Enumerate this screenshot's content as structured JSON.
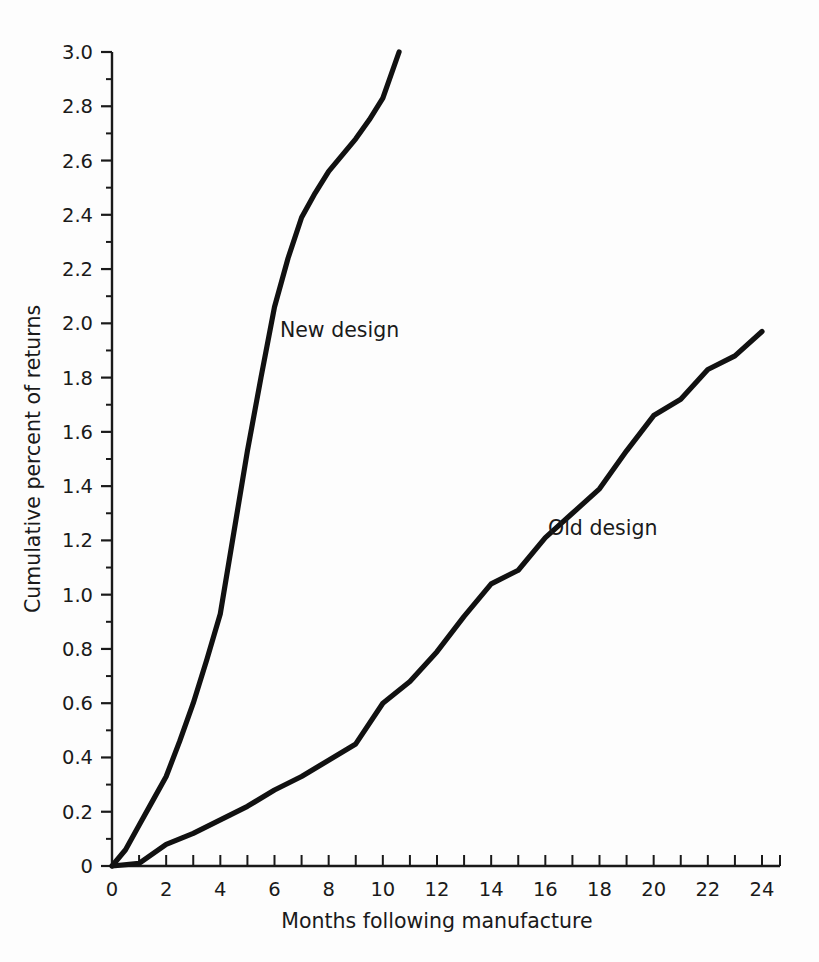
{
  "chart_data": {
    "type": "line",
    "title": "",
    "xlabel": "Months following manufacture",
    "ylabel": "Cumulative percent of returns",
    "xlim": [
      0,
      24
    ],
    "ylim": [
      0,
      3.0
    ],
    "x_tick_labels": [
      "0",
      "2",
      "4",
      "6",
      "8",
      "10",
      "12",
      "14",
      "16",
      "18",
      "20",
      "22",
      "24"
    ],
    "x_tick_values": [
      0,
      2,
      4,
      6,
      8,
      10,
      12,
      14,
      16,
      18,
      20,
      22,
      24
    ],
    "x_minor_step": 1,
    "y_tick_labels": [
      "0",
      "0.2",
      "0.4",
      "0.6",
      "0.8",
      "1.0",
      "1.2",
      "1.4",
      "1.6",
      "1.8",
      "2.0",
      "2.2",
      "2.4",
      "2.6",
      "2.8",
      "3.0"
    ],
    "y_tick_values": [
      0,
      0.2,
      0.4,
      0.6,
      0.8,
      1.0,
      1.2,
      1.4,
      1.6,
      1.8,
      2.0,
      2.2,
      2.4,
      2.6,
      2.8,
      3.0
    ],
    "grid": false,
    "legend_position": "inline-annotations",
    "line_color": "#111111",
    "background_color": "#fdfdfd",
    "series": [
      {
        "name": "New design",
        "label_x": 6.2,
        "label_y": 1.95,
        "x": [
          0,
          0.5,
          1,
          1.5,
          2,
          2.5,
          3,
          3.5,
          4,
          4.5,
          5,
          5.5,
          6,
          6.5,
          7,
          7.5,
          8,
          8.5,
          9,
          9.5,
          10,
          10.6
        ],
        "y": [
          0,
          0.06,
          0.15,
          0.24,
          0.33,
          0.46,
          0.6,
          0.76,
          0.93,
          1.23,
          1.53,
          1.8,
          2.06,
          2.24,
          2.39,
          2.48,
          2.56,
          2.62,
          2.68,
          2.75,
          2.83,
          3.0
        ]
      },
      {
        "name": "Old design",
        "label_x": 16.1,
        "label_y": 1.22,
        "x": [
          0,
          1,
          2,
          3,
          4,
          5,
          6,
          7,
          8,
          9,
          10,
          11,
          12,
          13,
          14,
          15,
          16,
          17,
          18,
          19,
          20,
          21,
          22,
          23,
          24
        ],
        "y": [
          0,
          0.01,
          0.08,
          0.12,
          0.17,
          0.22,
          0.28,
          0.33,
          0.39,
          0.45,
          0.6,
          0.68,
          0.79,
          0.92,
          1.04,
          1.09,
          1.21,
          1.3,
          1.39,
          1.53,
          1.66,
          1.72,
          1.83,
          1.88,
          1.97
        ]
      }
    ]
  }
}
